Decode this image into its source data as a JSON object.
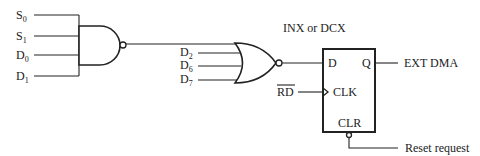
{
  "diagram": {
    "type": "logic-circuit",
    "nand_gate": {
      "inputs": [
        {
          "label": "S",
          "sub": "0"
        },
        {
          "label": "S",
          "sub": "1"
        },
        {
          "label": "D",
          "sub": "0"
        },
        {
          "label": "D",
          "sub": "1"
        }
      ]
    },
    "nor_gate": {
      "inputs": [
        {
          "label": "D",
          "sub": "2"
        },
        {
          "label": "D",
          "sub": "6"
        },
        {
          "label": "D",
          "sub": "7"
        }
      ]
    },
    "flipflop": {
      "title": "INX or DCX",
      "d_pin": "D",
      "q_pin": "Q",
      "clk_pin": "CLK",
      "clr_pin": "CLR",
      "clock_input": "RD",
      "output": "EXT DMA",
      "clear_input": "Reset request"
    },
    "colors": {
      "line": "#222222",
      "background": "#ffffff"
    }
  }
}
